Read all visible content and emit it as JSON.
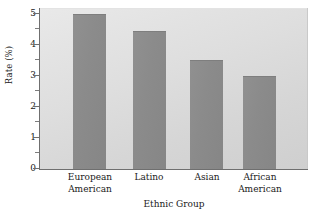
{
  "chart_data": {
    "type": "bar",
    "title": "",
    "categories": [
      "European American",
      "Latino",
      "Asian",
      "African American"
    ],
    "category_lines": [
      [
        "European",
        "American"
      ],
      [
        "Latino",
        ""
      ],
      [
        "Asian",
        ""
      ],
      [
        "African",
        "American"
      ]
    ],
    "values": [
      4.8,
      4.3,
      3.4,
      2.9
    ],
    "xlabel": "Ethnic Group",
    "ylabel": "Rate (%)",
    "ylim": [
      0,
      5
    ],
    "ytick_labels": [
      "5",
      "4",
      "3",
      "2",
      "1",
      "0"
    ],
    "ytick_values": [
      5,
      4,
      3,
      2,
      1,
      0
    ],
    "yminor_tick_values": [
      4.5,
      3.5,
      2.5,
      1.5,
      0.5
    ],
    "grid": false,
    "legend": null,
    "bar_color": "#8b8b8b",
    "plot_background": "#dedede",
    "axis_color": "#6f6f6f",
    "text_color": "#1a1a1a"
  }
}
